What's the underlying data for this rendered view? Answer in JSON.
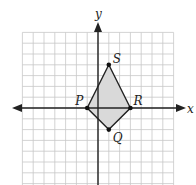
{
  "diagram": {
    "type": "coordinate-plane",
    "axes": {
      "x_label": "x",
      "y_label": "y"
    },
    "grid": {
      "x_min": -7,
      "x_max": 7,
      "y_min": -7,
      "y_max": 7,
      "color": "#c8c8c8"
    },
    "polygon": {
      "fill": "#d9d9d9",
      "stroke": "#222222",
      "vertices": [
        {
          "label": "P",
          "x": -1,
          "y": 0
        },
        {
          "label": "S",
          "x": 1,
          "y": 4
        },
        {
          "label": "R",
          "x": 3,
          "y": 0
        },
        {
          "label": "Q",
          "x": 1,
          "y": -2
        }
      ]
    }
  }
}
